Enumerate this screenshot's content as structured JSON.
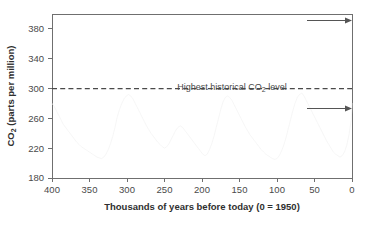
{
  "chart_data": {
    "type": "line",
    "title": "",
    "xlabel": "Thousands of years before today (0 = 1950)",
    "ylabel": "CO2 (parts per million)",
    "ylabel_main": "CO",
    "ylabel_sub": "2",
    "ylabel_rest": " (parts per million)",
    "xlim": [
      400,
      0
    ],
    "ylim": [
      180,
      400
    ],
    "xticks": [
      400,
      350,
      300,
      250,
      200,
      150,
      100,
      50,
      0
    ],
    "yticks": [
      180,
      220,
      260,
      300,
      340,
      380
    ],
    "grid": false,
    "legend": "none",
    "annotations": [
      {
        "name": "highest-historical-co2-level",
        "text_main": "Highest historical CO",
        "text_sub": "2",
        "text_rest": " level",
        "text_full": "Highest historical CO2 level",
        "value": 300,
        "style": "dashed-horizontal-line"
      },
      {
        "name": "upper-arrow",
        "text": "",
        "style": "right-arrow",
        "y_value": 397,
        "x_from": 60,
        "x_to": 2
      },
      {
        "name": "lower-arrow",
        "text": "",
        "style": "right-arrow",
        "y_value": 288,
        "x_from": 60,
        "x_to": 2
      }
    ],
    "series": [
      {
        "name": "Ice-core CO2 record",
        "color": "#f2f2f2",
        "x": [
          400,
          397,
          394,
          391,
          388,
          385,
          382,
          379,
          376,
          373,
          370,
          367,
          364,
          361,
          358,
          355,
          352,
          349,
          346,
          343,
          340,
          337,
          334,
          331,
          328,
          325,
          322,
          319,
          316,
          313,
          310,
          307,
          304,
          301,
          298,
          295,
          292,
          289,
          286,
          283,
          280,
          277,
          274,
          271,
          268,
          265,
          262,
          259,
          256,
          253,
          250,
          247,
          244,
          241,
          238,
          235,
          232,
          229,
          226,
          223,
          220,
          217,
          214,
          211,
          208,
          205,
          202,
          199,
          196,
          193,
          190,
          187,
          184,
          181,
          178,
          175,
          172,
          169,
          166,
          163,
          160,
          157,
          154,
          151,
          148,
          145,
          142,
          139,
          136,
          133,
          130,
          127,
          124,
          121,
          118,
          115,
          112,
          109,
          106,
          103,
          100,
          97,
          94,
          91,
          88,
          85,
          82,
          79,
          76,
          73,
          70,
          67,
          64,
          61,
          58,
          55,
          52,
          49,
          46,
          43,
          40,
          37,
          34,
          31,
          28,
          25,
          22,
          19,
          16,
          13,
          10,
          7,
          4,
          1,
          0
        ],
        "values": [
          280,
          276,
          270,
          264,
          258,
          252,
          248,
          244,
          240,
          236,
          232,
          228,
          225,
          222,
          220,
          218,
          216,
          214,
          212,
          210,
          208,
          207,
          206,
          208,
          212,
          218,
          226,
          236,
          248,
          262,
          272,
          280,
          286,
          290,
          292,
          290,
          286,
          280,
          274,
          268,
          262,
          256,
          250,
          245,
          240,
          236,
          232,
          228,
          225,
          222,
          220,
          222,
          226,
          232,
          238,
          244,
          248,
          250,
          248,
          244,
          240,
          236,
          232,
          228,
          224,
          220,
          216,
          212,
          210,
          212,
          218,
          226,
          236,
          248,
          260,
          272,
          282,
          288,
          290,
          288,
          284,
          278,
          272,
          266,
          260,
          254,
          248,
          243,
          238,
          234,
          230,
          226,
          222,
          218,
          215,
          212,
          210,
          208,
          206,
          205,
          206,
          210,
          216,
          224,
          234,
          246,
          258,
          270,
          280,
          288,
          292,
          294,
          290,
          284,
          278,
          272,
          266,
          260,
          254,
          248,
          242,
          236,
          230,
          225,
          220,
          215,
          212,
          210,
          208,
          210,
          215,
          224,
          238,
          258,
          280
        ]
      }
    ]
  }
}
